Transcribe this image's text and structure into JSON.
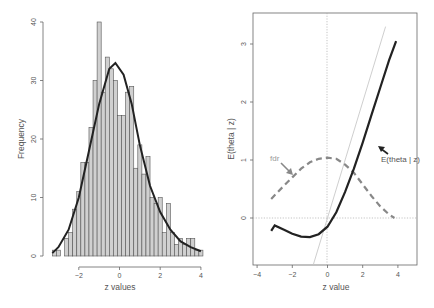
{
  "chart_data": [
    {
      "type": "bar",
      "subtype": "histogram_with_density_curve",
      "title": "",
      "xlabel": "z values",
      "ylabel": "Frequency",
      "xlim": [
        -3.4,
        4.3
      ],
      "ylim": [
        0,
        40
      ],
      "x_ticks": [
        -2,
        0,
        2,
        4
      ],
      "y_ticks": [
        0,
        10,
        20,
        30,
        40
      ],
      "grid": false,
      "bin_width": 0.2,
      "bin_start": -3.3,
      "bins": [
        {
          "x0": -3.3,
          "count": 1
        },
        {
          "x0": -3.1,
          "count": 1
        },
        {
          "x0": -2.9,
          "count": 0
        },
        {
          "x0": -2.7,
          "count": 3
        },
        {
          "x0": -2.5,
          "count": 4
        },
        {
          "x0": -2.3,
          "count": 8
        },
        {
          "x0": -2.1,
          "count": 11
        },
        {
          "x0": -1.9,
          "count": 16
        },
        {
          "x0": -1.7,
          "count": 16
        },
        {
          "x0": -1.5,
          "count": 22
        },
        {
          "x0": -1.3,
          "count": 30
        },
        {
          "x0": -1.1,
          "count": 40
        },
        {
          "x0": -0.9,
          "count": 28
        },
        {
          "x0": -0.7,
          "count": 34
        },
        {
          "x0": -0.5,
          "count": 32
        },
        {
          "x0": -0.3,
          "count": 30
        },
        {
          "x0": -0.1,
          "count": 24
        },
        {
          "x0": 0.1,
          "count": 24
        },
        {
          "x0": 0.3,
          "count": 28
        },
        {
          "x0": 0.5,
          "count": 29
        },
        {
          "x0": 0.7,
          "count": 15
        },
        {
          "x0": 0.9,
          "count": 19
        },
        {
          "x0": 1.1,
          "count": 14
        },
        {
          "x0": 1.3,
          "count": 17
        },
        {
          "x0": 1.5,
          "count": 10
        },
        {
          "x0": 1.7,
          "count": 9
        },
        {
          "x0": 1.9,
          "count": 10
        },
        {
          "x0": 2.1,
          "count": 4
        },
        {
          "x0": 2.3,
          "count": 9
        },
        {
          "x0": 2.5,
          "count": 4
        },
        {
          "x0": 2.7,
          "count": 2
        },
        {
          "x0": 2.9,
          "count": 3
        },
        {
          "x0": 3.1,
          "count": 2
        },
        {
          "x0": 3.3,
          "count": 3
        },
        {
          "x0": 3.5,
          "count": 3
        },
        {
          "x0": 3.7,
          "count": 1
        },
        {
          "x0": 3.9,
          "count": 1
        }
      ],
      "density_curve": {
        "description": "smooth fitted density scaled to counts, peak ~33 near z = -0.2",
        "points": [
          [
            -3.3,
            0.5
          ],
          [
            -3.0,
            1.5
          ],
          [
            -2.5,
            4.5
          ],
          [
            -2.0,
            10
          ],
          [
            -1.5,
            18
          ],
          [
            -1.0,
            26
          ],
          [
            -0.5,
            32
          ],
          [
            -0.2,
            33
          ],
          [
            0.2,
            31
          ],
          [
            0.6,
            26
          ],
          [
            1.0,
            19
          ],
          [
            1.5,
            12
          ],
          [
            2.0,
            7.5
          ],
          [
            2.5,
            4.5
          ],
          [
            3.0,
            2.5
          ],
          [
            3.5,
            1.5
          ],
          [
            4.0,
            0.8
          ]
        ]
      },
      "bar_color": "#d0d0d0",
      "curve_color": "#222222"
    },
    {
      "type": "line",
      "title": "",
      "xlabel": "z value",
      "ylabel": "E(theta | z)",
      "xlim": [
        -4.3,
        5.2
      ],
      "ylim": [
        -0.8,
        3.5
      ],
      "x_ticks": [
        -4,
        -2,
        0,
        2,
        4
      ],
      "y_ticks": [
        0,
        1,
        2,
        3
      ],
      "grid": false,
      "reference_lines": [
        {
          "kind": "horizontal",
          "y": 0,
          "style": "dotted"
        },
        {
          "kind": "vertical",
          "x": 0,
          "style": "dotted"
        },
        {
          "kind": "identity",
          "slope": 1,
          "intercept": 0,
          "style": "thin light gray"
        }
      ],
      "series": [
        {
          "name": "E(theta | z)",
          "style": "solid thick",
          "color": "#222222",
          "points": [
            [
              -3.2,
              -0.22
            ],
            [
              -3.0,
              -0.13
            ],
            [
              -2.5,
              -0.2
            ],
            [
              -2.0,
              -0.27
            ],
            [
              -1.5,
              -0.32
            ],
            [
              -1.0,
              -0.33
            ],
            [
              -0.5,
              -0.28
            ],
            [
              0.0,
              -0.15
            ],
            [
              0.5,
              0.1
            ],
            [
              1.0,
              0.45
            ],
            [
              1.5,
              0.85
            ],
            [
              2.0,
              1.3
            ],
            [
              2.5,
              1.78
            ],
            [
              3.0,
              2.25
            ],
            [
              3.5,
              2.72
            ],
            [
              3.9,
              3.05
            ]
          ]
        },
        {
          "name": "fdr",
          "style": "dashed thick",
          "color": "#888888",
          "points": [
            [
              -3.2,
              0.33
            ],
            [
              -2.5,
              0.55
            ],
            [
              -2.0,
              0.7
            ],
            [
              -1.5,
              0.85
            ],
            [
              -1.0,
              0.96
            ],
            [
              -0.5,
              1.02
            ],
            [
              0.0,
              1.04
            ],
            [
              0.5,
              1.02
            ],
            [
              1.0,
              0.92
            ],
            [
              1.5,
              0.78
            ],
            [
              2.0,
              0.58
            ],
            [
              2.5,
              0.38
            ],
            [
              3.0,
              0.2
            ],
            [
              3.5,
              0.06
            ],
            [
              3.8,
              0.0
            ]
          ]
        }
      ],
      "annotations": [
        {
          "text": "fdr",
          "x": -2.1,
          "y": 1.0,
          "arrow_to": [
            -1.7,
            0.75
          ]
        },
        {
          "text": "E(theta | z)",
          "x": 3.8,
          "y": 1.55,
          "arrow_to": [
            3.2,
            1.8
          ]
        }
      ]
    }
  ],
  "labels": {
    "left_xlabel": "z values",
    "left_ylabel": "Frequency",
    "right_xlabel": "z value",
    "right_ylabel": "E(theta | z)",
    "fdr_annotation": "fdr",
    "etheta_annotation": "E(theta | z)"
  }
}
